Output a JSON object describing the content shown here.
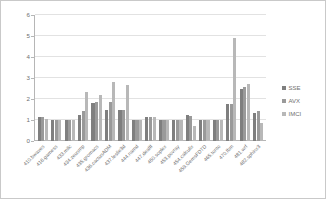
{
  "chart_data": {
    "type": "bar",
    "title": "",
    "subtitle": "",
    "xlabel": "",
    "ylabel": "",
    "ylim": [
      0,
      6
    ],
    "yticks": [
      0,
      1,
      2,
      3,
      4,
      5,
      6
    ],
    "ytick_labels": [
      "0",
      "1",
      "2",
      "3",
      "4",
      "5",
      "6"
    ],
    "grid": true,
    "legend_position": "right",
    "categories": [
      "410.bwaves",
      "416.gamess",
      "433.milc",
      "434.zeusmp",
      "435.gromacs",
      "436.cactusADM",
      "437.leslie3d",
      "444.namd",
      "447.dealII",
      "450.soplex",
      "453.povray",
      "454.calculix",
      "459.GemsFDTD",
      "465.tonto",
      "470.lbm",
      "481.wrf",
      "482.sphinx3"
    ],
    "series": [
      {
        "name": "SSE",
        "color": "#7f7f7f",
        "values": [
          1.12,
          1.0,
          1.0,
          1.25,
          1.8,
          1.5,
          1.5,
          1.0,
          1.12,
          1.0,
          1.0,
          1.23,
          1.0,
          1.0,
          1.78,
          2.48,
          1.32
        ]
      },
      {
        "name": "AVX",
        "color": "#9a9a9a",
        "values": [
          1.16,
          1.0,
          1.0,
          1.45,
          1.85,
          1.85,
          1.5,
          1.0,
          1.12,
          1.0,
          1.0,
          1.2,
          1.0,
          1.0,
          1.78,
          2.55,
          1.42
        ]
      },
      {
        "name": "IMCI",
        "color": "#b8b8b8",
        "values": [
          1.06,
          1.0,
          1.0,
          2.32,
          2.2,
          2.82,
          2.66,
          1.0,
          1.12,
          1.0,
          1.0,
          0.72,
          1.0,
          1.0,
          4.9,
          2.72,
          0.86
        ]
      }
    ]
  },
  "legend": {
    "entries": [
      {
        "label": "SSE"
      },
      {
        "label": "AVX"
      },
      {
        "label": "IMCI"
      }
    ]
  }
}
